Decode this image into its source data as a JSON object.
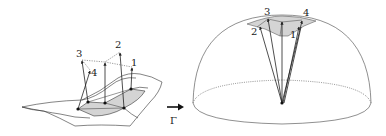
{
  "diagram": {
    "type": "surface-to-hemisphere normal mapping",
    "left_figure": {
      "description": "curved surface patch with shaded region and normal vectors",
      "labels": [
        "1",
        "2",
        "3",
        "4"
      ]
    },
    "mapping": {
      "symbol": "Γ",
      "arrow": "right-arrow"
    },
    "right_figure": {
      "description": "hemisphere with normals projected from center to shaded spherical region",
      "labels": [
        "1",
        "2",
        "3",
        "4"
      ]
    },
    "colors": {
      "stroke": "#222222",
      "shade": "#d4d4d4",
      "dotted": "#555555",
      "background": "#ffffff"
    }
  }
}
